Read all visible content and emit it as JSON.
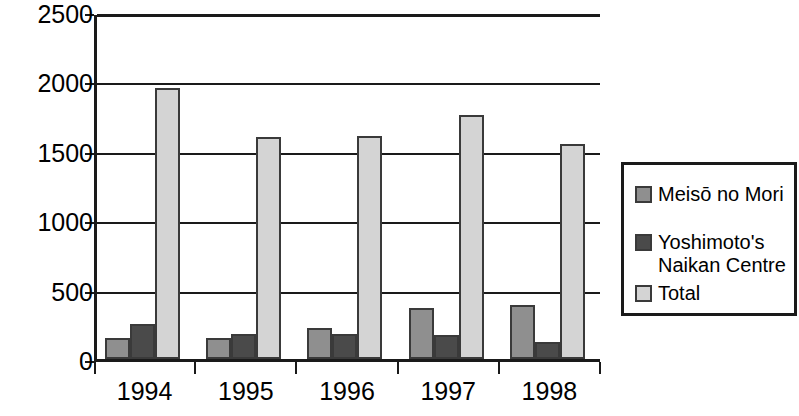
{
  "chart_data": {
    "type": "bar",
    "title": "",
    "subtitle": "",
    "xlabel": "",
    "ylabel": "",
    "categories": [
      "1994",
      "1995",
      "1996",
      "1997",
      "1998"
    ],
    "series": [
      {
        "name": "Meisō no Mori",
        "color": "#8f8f8f",
        "values": [
          150,
          150,
          220,
          370,
          390
        ]
      },
      {
        "name": "Yoshimoto's\nNaikan Centre",
        "color": "#4a4a4a",
        "values": [
          250,
          180,
          180,
          175,
          120
        ]
      },
      {
        "name": "Total",
        "color": "#d4d4d4",
        "values": [
          1950,
          1600,
          1605,
          1755,
          1550
        ]
      }
    ],
    "ylim": [
      0,
      2500
    ],
    "ytick_values": [
      0,
      500,
      1000,
      1500,
      2000,
      2500
    ],
    "ytick_labels": [
      "0",
      "500",
      "1000",
      "1500",
      "2000",
      "2500"
    ],
    "grid": true,
    "grid_axis": "y",
    "legend_position": "right",
    "legend_entries": [
      "Meisō no Mori",
      "Yoshimoto's\nNaikan Centre",
      "Total"
    ]
  }
}
